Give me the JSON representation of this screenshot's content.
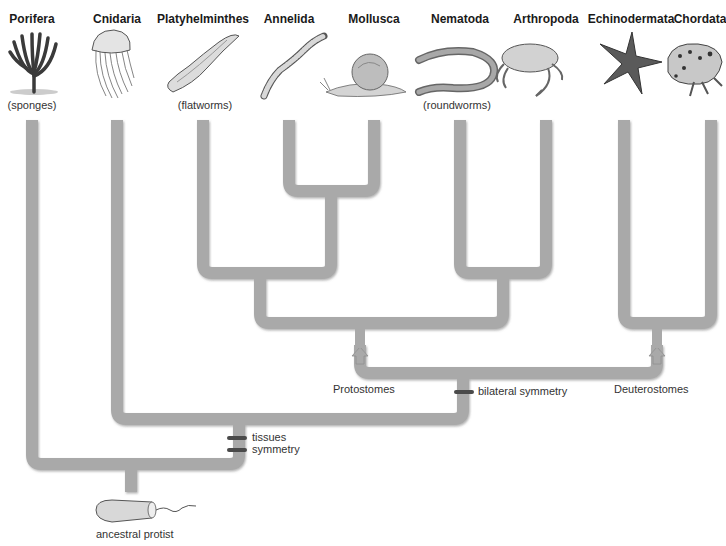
{
  "diagram": {
    "type": "phylogenetic-tree",
    "branch_color": "#a9a9a9",
    "branch_shadow_color": "#8c8c8c",
    "marker_color": "#4a4a4a",
    "taxa": [
      {
        "name": "Porifera",
        "common_name": "(sponges)",
        "x": 32,
        "icon": "sponge-illustration"
      },
      {
        "name": "Cnidaria",
        "common_name": "",
        "x": 117,
        "icon": "jellyfish-illustration"
      },
      {
        "name": "Platyhelminthes",
        "common_name": "(flatworms)",
        "x": 203,
        "icon": "flatworm-illustration"
      },
      {
        "name": "Annelida",
        "common_name": "",
        "x": 289,
        "icon": "segmented-worm-illustration"
      },
      {
        "name": "Mollusca",
        "common_name": "",
        "x": 374,
        "icon": "snail-illustration"
      },
      {
        "name": "Nematoda",
        "common_name": "(roundworms)",
        "x": 460,
        "icon": "roundworm-illustration"
      },
      {
        "name": "Arthropoda",
        "common_name": "",
        "x": 546,
        "icon": "crab-illustration"
      },
      {
        "name": "Echinodermata",
        "common_name": "",
        "x": 631,
        "icon": "starfish-illustration"
      },
      {
        "name": "Chordata",
        "common_name": "",
        "x": 711,
        "icon": "frog-illustration"
      }
    ],
    "clade_labels": {
      "protostomes": "Protostomes",
      "deuterostomes": "Deuterostomes"
    },
    "traits": {
      "bilateral_symmetry": "bilateral symmetry",
      "tissues": "tissues",
      "symmetry": "symmetry"
    },
    "root": {
      "label": "ancestral protist",
      "icon": "protist-illustration"
    }
  }
}
